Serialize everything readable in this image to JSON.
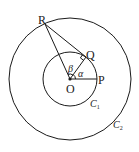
{
  "diagram": {
    "points": {
      "R": "R",
      "Q": "Q",
      "P": "P",
      "O": "O"
    },
    "angles": {
      "alpha": "α",
      "beta": "β"
    },
    "circles": {
      "inner": {
        "name": "C",
        "subscript": "1"
      },
      "outer": {
        "name": "C",
        "subscript": "2"
      }
    },
    "right_angle_at": "Q",
    "colors": {
      "ink": "#1a1a1a",
      "background": "#ffffff"
    }
  }
}
